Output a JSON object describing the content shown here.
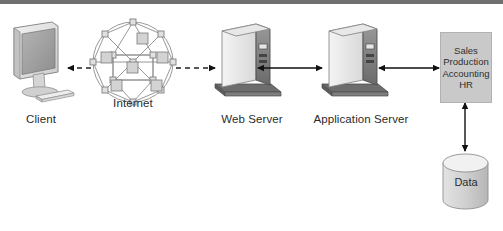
{
  "diagram": {
    "background_color": "#ffffff",
    "top_band_color": "#6f6f6f"
  },
  "nodes": {
    "client": {
      "label": "Client",
      "icon": "desktop-monitor-keyboard-icon"
    },
    "internet": {
      "label": "Internet",
      "icon": "internet-mesh-cloud-icon"
    },
    "web_server": {
      "label": "Web Server",
      "icon": "server-tower-icon"
    },
    "application_server": {
      "label": "Application Server",
      "icon": "server-tower-icon"
    },
    "departments": {
      "lines": [
        "Sales",
        "Production",
        "Accounting",
        "HR"
      ],
      "fill_color": "#c9c9c9"
    },
    "data_store": {
      "label": "Data",
      "icon": "database-cylinder-icon"
    }
  },
  "connections": [
    {
      "from": "client",
      "to": "internet",
      "style": "dashed",
      "arrows": "both"
    },
    {
      "from": "internet",
      "to": "web_server",
      "style": "dashed",
      "arrows": "both"
    },
    {
      "from": "web_server",
      "to": "application_server",
      "style": "solid",
      "arrows": "both"
    },
    {
      "from": "application_server",
      "to": "departments",
      "style": "solid",
      "arrows": "both"
    },
    {
      "from": "departments",
      "to": "data_store",
      "style": "solid",
      "arrows": "both"
    }
  ]
}
